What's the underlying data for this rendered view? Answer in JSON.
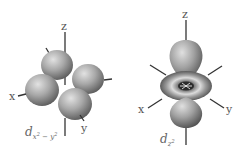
{
  "diagram": {
    "orbitals": [
      {
        "name": "d_x2-y2",
        "label_main": "d",
        "label_sub_x": "x",
        "label_sub_minus": " − ",
        "label_sub_y": "y",
        "label_exp": "2",
        "axes": {
          "x": "x",
          "y": "y",
          "z": "z"
        },
        "lobes": 4
      },
      {
        "name": "d_z2",
        "label_main": "d",
        "label_sub_z": "z",
        "label_exp": "2",
        "axes": {
          "x": "x",
          "y": "y",
          "z": "z"
        },
        "lobes": 2,
        "has_torus": true
      }
    ],
    "colors": {
      "lobe_light": "#d6d6d6",
      "lobe_mid": "#9a9a9a",
      "lobe_dark": "#5a5a5a",
      "axis": "#333333",
      "label": "#555555"
    }
  }
}
